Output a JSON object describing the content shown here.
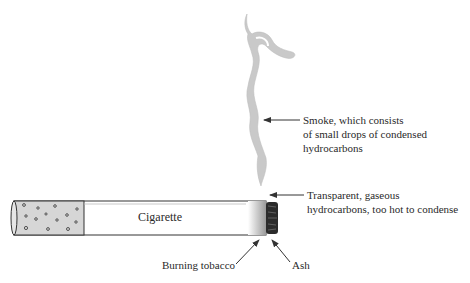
{
  "diagram": {
    "cigarette_label": "Cigarette",
    "labels": {
      "smoke": [
        "Smoke, which consists",
        "of small drops of condensed",
        "hydrocarbons"
      ],
      "gaseous": [
        "Transparent, gaseous",
        "hydrocarbons, too hot to condense"
      ],
      "burning_tobacco": "Burning tobacco",
      "ash": "Ash"
    },
    "colors": {
      "smoke": "#c8c8c8",
      "filter": "#d6d6d6",
      "ash": "#2b2b2b",
      "outline": "#333333"
    }
  }
}
